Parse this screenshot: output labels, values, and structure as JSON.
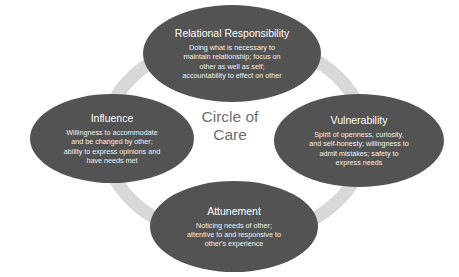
{
  "diagram": {
    "center": {
      "line1": "Circle of",
      "line2": "Care"
    },
    "colors": {
      "node_fill": "#535353",
      "node_text": "#ffffff",
      "ring": "#d8d8d8",
      "center_text": "#6f6f6f",
      "background": "#ffffff"
    },
    "nodes": [
      {
        "id": "relational-responsibility",
        "title": "Relational Responsibility",
        "body_lines": [
          "Doing what is necessary to",
          "maintain relationship; focus on",
          "other as well as self;",
          "accountability to effect on other"
        ]
      },
      {
        "id": "influence",
        "title": "Influence",
        "body_lines": [
          "Willingness to accommodate",
          "and be changed by other;",
          "ability to express opinions and",
          "have needs met"
        ]
      },
      {
        "id": "vulnerability",
        "title": "Vulnerability",
        "body_lines": [
          "Spirit of openness, curiosity,",
          "and self-honesty; willingness to",
          "admit mistakes; safety to",
          "express needs"
        ]
      },
      {
        "id": "attunement",
        "title": "Attunement",
        "body_lines": [
          "Noticing needs of other;",
          "attentive to and responsive to",
          "other's experience"
        ]
      }
    ]
  }
}
